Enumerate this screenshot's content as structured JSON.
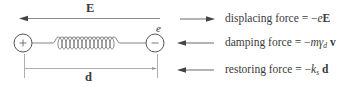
{
  "diagram": {
    "field_label": "E",
    "positive_charge": {
      "symbol": "+"
    },
    "negative_charge": {
      "symbol": "−",
      "label": "e"
    },
    "separation_label": "d",
    "colors": {
      "line": "#888888",
      "stroke": "#555555",
      "text": "#333333",
      "background": "#ffffff"
    }
  },
  "legend": {
    "items": [
      {
        "direction": "right",
        "name": "displacing force",
        "eq": " = −",
        "var_italic": "e",
        "var_bold": "E",
        "var_sub": "",
        "var_tail": ""
      },
      {
        "direction": "left",
        "name": "damping force",
        "eq": " = −",
        "var_italic": "mγ",
        "var_sub": "d",
        "var_tail": " ",
        "var_bold": "v"
      },
      {
        "direction": "left",
        "name": "restoring force",
        "eq": " = −",
        "var_italic": "k",
        "var_sub": "s",
        "var_tail": " ",
        "var_bold": "d"
      }
    ]
  }
}
